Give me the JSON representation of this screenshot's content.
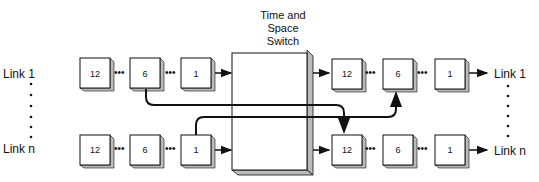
{
  "title": {
    "lines": [
      "Time and",
      "Space",
      "Switch"
    ]
  },
  "input_links": [
    {
      "label": "Link 1",
      "slots": [
        "12",
        "6",
        "1"
      ]
    },
    {
      "label": "Link n",
      "slots": [
        "12",
        "6",
        "1"
      ]
    }
  ],
  "output_links": [
    {
      "label": "Link 1",
      "slots": [
        "12",
        "6",
        "1"
      ]
    },
    {
      "label": "Link n",
      "slots": [
        "12",
        "6",
        "1"
      ]
    }
  ],
  "connections": [
    {
      "from": "Link 1 slot 6",
      "to": "Link n slot 12"
    },
    {
      "from": "Link n slot 1",
      "to": "Link 1 slot 6"
    }
  ],
  "colors": {
    "line": "#111111",
    "box_fill": "#ffffff",
    "shadow": "#c8c8c8"
  }
}
